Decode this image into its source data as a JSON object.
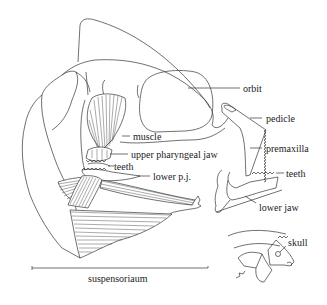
{
  "figure": {
    "line_color": "#333333",
    "background": "#ffffff"
  },
  "labels": {
    "orbit": "orbit",
    "pedicle": "pedicle",
    "premaxilla": "premaxilla",
    "teeth_oral": "teeth",
    "lower_jaw": "lower jaw",
    "muscle": "muscle",
    "upper_pharyngeal_jaw": "upper pharyngeal jaw",
    "teeth_pharyngeal": "teeth",
    "lower_pj": "lower p.j.",
    "skull": "skull",
    "suspensorium": "suspensoriaum"
  }
}
